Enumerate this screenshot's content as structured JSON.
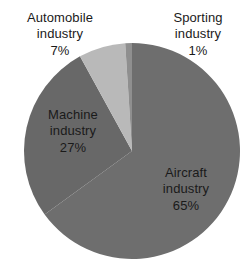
{
  "chart_data": {
    "type": "pie",
    "title": "",
    "xlabel": "",
    "ylabel": "",
    "legend_position": "none",
    "grid": false,
    "units": "percent",
    "total": 100,
    "start_angle_deg": 0,
    "direction": "clockwise",
    "categories": [
      "Aircraft industry",
      "Machine industry",
      "Automobile industry",
      "Sporting industry"
    ],
    "values": [
      65,
      27,
      7,
      1
    ],
    "slices": [
      {
        "name": "Aircraft industry",
        "value": 65,
        "value_label": "65%",
        "color": "#6e6e6e",
        "label_lines": [
          "Aircraft",
          "industry"
        ],
        "label_placement": "inside"
      },
      {
        "name": "Machine industry",
        "value": 27,
        "value_label": "27%",
        "color": "#686868",
        "label_lines": [
          "Machine",
          "industry"
        ],
        "label_placement": "inside"
      },
      {
        "name": "Automobile industry",
        "value": 7,
        "value_label": "7%",
        "color": "#b9b9b9",
        "label_lines": [
          "Automobile",
          "industry"
        ],
        "label_placement": "outside"
      },
      {
        "name": "Sporting industry",
        "value": 1,
        "value_label": "1%",
        "color": "#8f8f8f",
        "label_lines": [
          "Sporting",
          "industry"
        ],
        "label_placement": "outside"
      }
    ]
  },
  "labels": {
    "automobile": {
      "line1": "Automobile",
      "line2": "industry",
      "percent": "7%"
    },
    "sporting": {
      "line1": "Sporting",
      "line2": "industry",
      "percent": "1%"
    },
    "machine": {
      "line1": "Machine",
      "line2": "industry",
      "percent": "27%"
    },
    "aircraft": {
      "line1": "Aircraft",
      "line2": "industry",
      "percent": "65%"
    }
  },
  "geometry": {
    "center_x": 132,
    "center_y": 151,
    "radius": 108
  },
  "colors": {
    "background": "#ffffff",
    "text": "#1a1a1a",
    "aircraft": "#6e6e6e",
    "machine": "#686868",
    "automobile": "#b9b9b9",
    "sporting": "#8f8f8f"
  }
}
